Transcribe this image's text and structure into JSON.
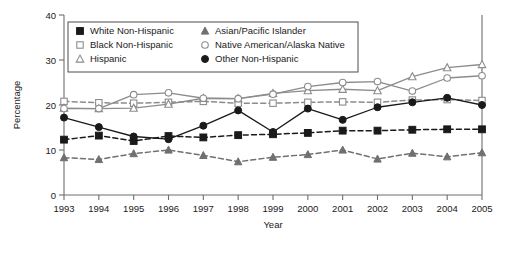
{
  "chart_data": {
    "type": "line",
    "title": "",
    "xlabel": "Year",
    "ylabel": "Percentage",
    "x": [
      1993,
      1994,
      1995,
      1996,
      1997,
      1998,
      1999,
      2000,
      2001,
      2002,
      2003,
      2004,
      2005
    ],
    "categories": [
      "1993",
      "1994",
      "1995",
      "1996",
      "1997",
      "1998",
      "1999",
      "2000",
      "2001",
      "2002",
      "2003",
      "2004",
      "2005"
    ],
    "xlim": [
      1993,
      2005
    ],
    "ylim": [
      0,
      40
    ],
    "yticks": [
      0,
      10,
      20,
      30,
      40
    ],
    "ytick_labels": [
      "0",
      "10",
      "20",
      "30",
      "40"
    ],
    "grid": false,
    "legend_position": "top-inside",
    "series": [
      {
        "name": "White Non-Hispanic",
        "marker": "filled-square",
        "color": "#1a1a1a",
        "linestyle": "dashed",
        "values": [
          12.3,
          13.2,
          12.0,
          13.1,
          12.8,
          13.3,
          13.5,
          13.8,
          14.3,
          14.3,
          14.5,
          14.6,
          14.6
        ]
      },
      {
        "name": "Black Non-Hispanic",
        "marker": "open-square",
        "color": "#8c8c8c",
        "linestyle": "dashed",
        "values": [
          20.8,
          20.5,
          20.4,
          20.6,
          20.8,
          20.4,
          20.4,
          20.6,
          20.7,
          20.6,
          21.1,
          21.2,
          21.0
        ]
      },
      {
        "name": "Hispanic",
        "marker": "open-triangle",
        "color": "#8c8c8c",
        "linestyle": "solid",
        "values": [
          19.3,
          19.2,
          19.3,
          20.2,
          21.5,
          21.4,
          22.6,
          23.2,
          23.5,
          23.2,
          26.3,
          28.3,
          29.0
        ]
      },
      {
        "name": "Asian/Pacific Islander",
        "marker": "filled-triangle",
        "color": "#707070",
        "linestyle": "dashed",
        "values": [
          8.3,
          7.9,
          9.2,
          10.0,
          8.8,
          7.4,
          8.4,
          9.0,
          10.0,
          8.0,
          9.3,
          8.5,
          9.4
        ]
      },
      {
        "name": "Native American/Alaska Native",
        "marker": "open-circle",
        "color": "#8c8c8c",
        "linestyle": "solid",
        "values": [
          19.2,
          19.2,
          22.3,
          22.7,
          21.5,
          21.4,
          22.4,
          24.1,
          25.0,
          25.2,
          23.1,
          26.0,
          26.5
        ]
      },
      {
        "name": "Other Non-Hispanic",
        "marker": "filled-circle",
        "color": "#1a1a1a",
        "linestyle": "solid",
        "values": [
          17.2,
          15.1,
          13.0,
          12.4,
          15.4,
          18.8,
          14.0,
          19.2,
          16.7,
          19.5,
          20.6,
          21.6,
          20.0
        ]
      }
    ]
  }
}
